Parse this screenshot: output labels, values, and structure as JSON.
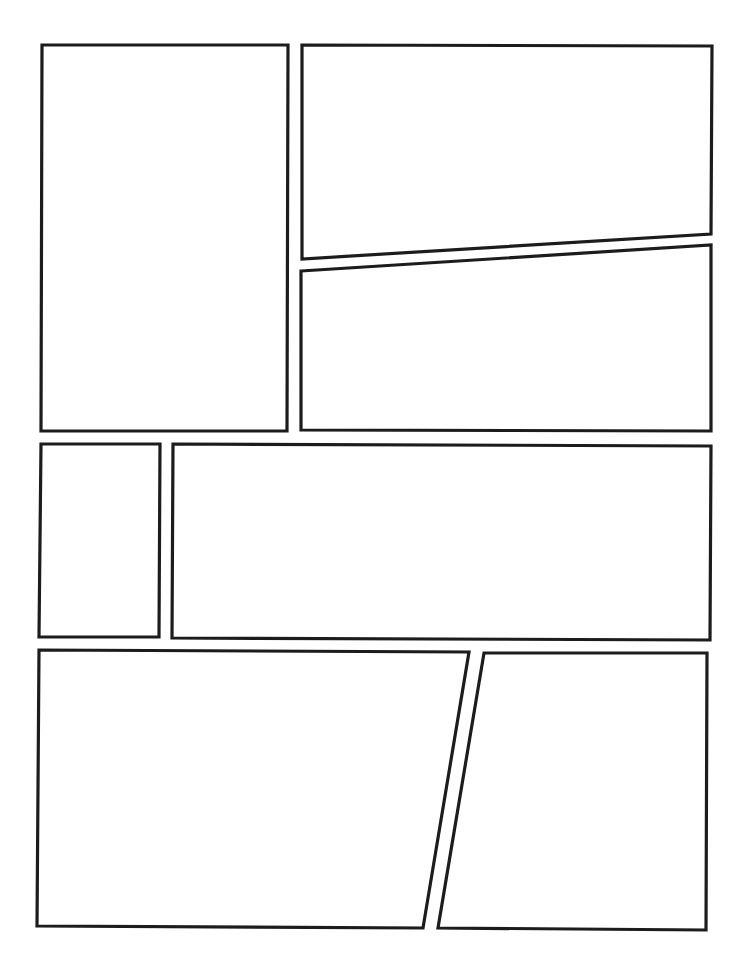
{
  "page": {
    "type": "comic-page-template",
    "width": 744,
    "height": 969,
    "background": "#ffffff",
    "border_color": "#1c1c1c",
    "border_width": 3.2
  },
  "panels": [
    {
      "id": 1,
      "label": "panel-1",
      "points": [
        [
          42,
          45
        ],
        [
          288,
          45
        ],
        [
          287,
          431
        ],
        [
          41,
          431
        ]
      ]
    },
    {
      "id": 2,
      "label": "panel-2",
      "points": [
        [
          302,
          45
        ],
        [
          712,
          46
        ],
        [
          711,
          234
        ],
        [
          302,
          259
        ]
      ]
    },
    {
      "id": 3,
      "label": "panel-3",
      "points": [
        [
          301,
          271
        ],
        [
          711,
          245
        ],
        [
          711,
          431
        ],
        [
          301,
          430
        ]
      ]
    },
    {
      "id": 4,
      "label": "panel-4",
      "points": [
        [
          41,
          444
        ],
        [
          160,
          444
        ],
        [
          159,
          637
        ],
        [
          39,
          637
        ]
      ]
    },
    {
      "id": 5,
      "label": "panel-5",
      "points": [
        [
          173,
          444
        ],
        [
          711,
          446
        ],
        [
          710,
          640
        ],
        [
          172,
          638
        ]
      ]
    },
    {
      "id": 6,
      "label": "panel-6",
      "points": [
        [
          39,
          650
        ],
        [
          469,
          652
        ],
        [
          423,
          928
        ],
        [
          37,
          926
        ]
      ]
    },
    {
      "id": 7,
      "label": "panel-7",
      "points": [
        [
          484,
          653
        ],
        [
          707,
          653
        ],
        [
          706,
          930
        ],
        [
          438,
          928
        ]
      ]
    }
  ]
}
